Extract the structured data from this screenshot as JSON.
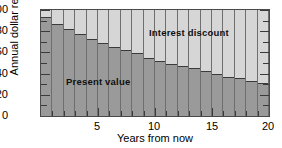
{
  "chart_data": {
    "type": "bar",
    "subtype": "stacked-bar",
    "title": "",
    "xlabel": "Years from now",
    "ylabel": "Annual dollar rental",
    "xlim": [
      0,
      20
    ],
    "ylim": [
      0,
      100
    ],
    "xticks": [
      5,
      10,
      15,
      20
    ],
    "xticklabels": [
      "5",
      "10",
      "15",
      "20"
    ],
    "yticks": [
      0,
      20,
      40,
      60,
      80,
      100
    ],
    "yticklabels": [
      "0",
      "20",
      "40",
      "60",
      "80",
      "100"
    ],
    "yminorticks": [
      10,
      30,
      50,
      70,
      90
    ],
    "grid": false,
    "legend": "in-plot annotations",
    "categories": [
      1,
      2,
      3,
      4,
      5,
      6,
      7,
      8,
      9,
      10,
      11,
      12,
      13,
      14,
      15,
      16,
      17,
      18,
      19,
      20
    ],
    "series": [
      {
        "name": "Present value",
        "color": "#9a9a9a",
        "values": [
          93,
          87,
          82,
          77,
          73,
          69,
          65,
          62,
          59,
          55,
          52,
          49,
          47,
          45,
          42,
          40,
          37,
          36,
          33,
          31
        ]
      },
      {
        "name": "Interest discount",
        "color": "#d6d6d6",
        "values": [
          7,
          13,
          18,
          23,
          27,
          31,
          35,
          38,
          41,
          45,
          48,
          51,
          53,
          55,
          58,
          60,
          63,
          64,
          67,
          69
        ]
      }
    ],
    "annotations": [
      {
        "text": "Interest discount",
        "x": 12.5,
        "y": 85
      },
      {
        "text": "Present value",
        "x": 5.0,
        "y": 37
      }
    ]
  },
  "figure": {
    "top_artifact": "",
    "series_labels": {
      "interest": "Interest discount",
      "present": "Present value"
    },
    "axis_titles": {
      "y": "Annual dollar rental",
      "x": "Years from now"
    }
  }
}
